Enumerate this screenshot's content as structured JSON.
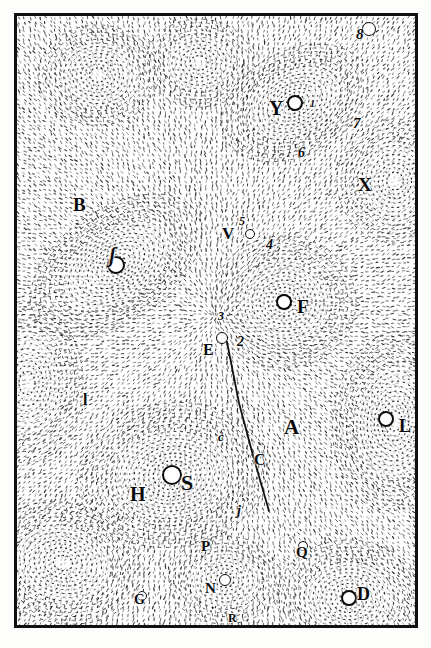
{
  "plate": {
    "kind": "engraved-plate",
    "description": "Descartes vortex cosmology plate",
    "background_color": "#ffffff",
    "ink_color": "#0a0a0a",
    "frame": {
      "x": 14,
      "y": 13,
      "w": 404,
      "h": 615,
      "border_px": 3
    }
  },
  "labels": [
    {
      "id": "S",
      "text": "S",
      "x": 178,
      "y": 469,
      "size": 22,
      "style": "roman"
    },
    {
      "id": "H",
      "text": "H",
      "x": 127,
      "y": 481,
      "size": 20,
      "style": "roman"
    },
    {
      "id": "F",
      "text": "F",
      "x": 294,
      "y": 294,
      "size": 19,
      "style": "roman"
    },
    {
      "id": "A",
      "text": "A",
      "x": 281,
      "y": 414,
      "size": 21,
      "style": "roman"
    },
    {
      "id": "B",
      "text": "B",
      "x": 70,
      "y": 192,
      "size": 19,
      "style": "roman"
    },
    {
      "id": "D",
      "text": "D",
      "x": 354,
      "y": 582,
      "size": 18,
      "style": "roman"
    },
    {
      "id": "E",
      "text": "E",
      "x": 200,
      "y": 339,
      "size": 16,
      "style": "roman"
    },
    {
      "id": "L",
      "text": "L",
      "x": 396,
      "y": 414,
      "size": 18,
      "style": "roman"
    },
    {
      "id": "N",
      "text": "N",
      "x": 202,
      "y": 578,
      "size": 15,
      "style": "roman"
    },
    {
      "id": "P",
      "text": "P",
      "x": 198,
      "y": 536,
      "size": 15,
      "style": "roman"
    },
    {
      "id": "Q",
      "text": "Q",
      "x": 293,
      "y": 542,
      "size": 15,
      "style": "roman"
    },
    {
      "id": "R",
      "text": "R",
      "x": 225,
      "y": 609,
      "size": 12,
      "style": "roman"
    },
    {
      "id": "M",
      "text": "M",
      "x": 222,
      "y": 621,
      "size": 12,
      "style": "roman"
    },
    {
      "id": "G",
      "text": "G",
      "x": 131,
      "y": 590,
      "size": 14,
      "style": "roman"
    },
    {
      "id": "V",
      "text": "V",
      "x": 219,
      "y": 222,
      "size": 17,
      "style": "roman"
    },
    {
      "id": "X",
      "text": "X",
      "x": 355,
      "y": 172,
      "size": 19,
      "style": "roman"
    },
    {
      "id": "Y",
      "text": "Y",
      "x": 266,
      "y": 95,
      "size": 20,
      "style": "roman"
    },
    {
      "id": "C-upper",
      "text": "C",
      "x": 251,
      "y": 449,
      "size": 16,
      "style": "roman"
    },
    {
      "id": "c-lower",
      "text": "c",
      "x": 215,
      "y": 427,
      "size": 13,
      "style": "italic"
    },
    {
      "id": "j",
      "text": "j",
      "x": 234,
      "y": 501,
      "size": 14,
      "style": "italic"
    },
    {
      "id": "l-left",
      "text": "l",
      "x": 80,
      "y": 389,
      "size": 16,
      "style": "roman"
    },
    {
      "id": "longs",
      "text": "ʃ",
      "x": 106,
      "y": 242,
      "size": 20,
      "style": "italic"
    }
  ],
  "numerals": [
    {
      "id": "n8",
      "text": "8",
      "x": 353,
      "y": 24,
      "size": 15
    },
    {
      "id": "n7",
      "text": "7",
      "x": 350,
      "y": 113,
      "size": 15
    },
    {
      "id": "n6",
      "text": "6",
      "x": 295,
      "y": 143,
      "size": 14
    },
    {
      "id": "n5",
      "text": "5",
      "x": 236,
      "y": 212,
      "size": 12
    },
    {
      "id": "n4",
      "text": "4",
      "x": 263,
      "y": 235,
      "size": 14
    },
    {
      "id": "n3",
      "text": "3",
      "x": 215,
      "y": 307,
      "size": 12
    },
    {
      "id": "n2",
      "text": "2",
      "x": 234,
      "y": 332,
      "size": 14
    },
    {
      "id": "n1",
      "text": "1",
      "x": 307,
      "y": 96,
      "size": 10
    }
  ],
  "bodies": [
    {
      "id": "sun-S",
      "cx": 169,
      "cy": 472,
      "r": 10
    },
    {
      "id": "star-F",
      "cx": 281,
      "cy": 299,
      "r": 8
    },
    {
      "id": "star-Y",
      "cx": 292,
      "cy": 100,
      "r": 8
    },
    {
      "id": "star-L",
      "cx": 383,
      "cy": 416,
      "r": 8
    },
    {
      "id": "star-D",
      "cx": 346,
      "cy": 595,
      "r": 8
    },
    {
      "id": "star-long-s",
      "cx": 113,
      "cy": 262,
      "r": 9
    },
    {
      "id": "star-8",
      "cx": 366,
      "cy": 26,
      "r": 7
    },
    {
      "id": "star-E",
      "cx": 219,
      "cy": 335,
      "r": 6
    },
    {
      "id": "star-N",
      "cx": 222,
      "cy": 577,
      "r": 6
    },
    {
      "id": "star-4",
      "cx": 247,
      "cy": 231,
      "r": 5
    },
    {
      "id": "star-Q",
      "cx": 300,
      "cy": 543,
      "r": 5
    },
    {
      "id": "star-G",
      "cx": 139,
      "cy": 593,
      "r": 5
    }
  ],
  "comet_path": {
    "id": "comet-trajectory",
    "points": [
      [
        224,
        339
      ],
      [
        236,
        400
      ],
      [
        251,
        456
      ],
      [
        266,
        508
      ]
    ],
    "stroke": "#111111",
    "width": 1.8
  },
  "vortices": [
    {
      "id": "vortex-unlabeled-topleft",
      "cx": 95,
      "cy": 72,
      "rings": 7,
      "rx": 60,
      "ry": 50,
      "rot": 0
    },
    {
      "id": "vortex-longs",
      "cx": 113,
      "cy": 262,
      "rings": 9,
      "rx": 96,
      "ry": 56,
      "rot": -34
    },
    {
      "id": "vortex-F",
      "cx": 281,
      "cy": 299,
      "rings": 9,
      "rx": 72,
      "ry": 66,
      "rot": 0
    },
    {
      "id": "vortex-Y",
      "cx": 292,
      "cy": 100,
      "rings": 8,
      "rx": 78,
      "ry": 52,
      "rot": -28
    },
    {
      "id": "vortex-S",
      "cx": 169,
      "cy": 472,
      "rings": 10,
      "rx": 95,
      "ry": 72,
      "rot": -8
    },
    {
      "id": "vortex-L",
      "cx": 392,
      "cy": 418,
      "rings": 9,
      "rx": 62,
      "ry": 90,
      "rot": 6
    },
    {
      "id": "vortex-D",
      "cx": 346,
      "cy": 595,
      "rings": 8,
      "rx": 72,
      "ry": 58,
      "rot": 0
    },
    {
      "id": "vortex-lowerleft",
      "cx": 60,
      "cy": 560,
      "rings": 8,
      "rx": 78,
      "ry": 60,
      "rot": 14
    },
    {
      "id": "vortex-N",
      "cx": 222,
      "cy": 577,
      "rings": 6,
      "rx": 56,
      "ry": 44,
      "rot": 0
    },
    {
      "id": "vortex-X",
      "cx": 392,
      "cy": 178,
      "rings": 7,
      "rx": 58,
      "ry": 62,
      "rot": 0
    },
    {
      "id": "vortex-left",
      "cx": 24,
      "cy": 380,
      "rings": 7,
      "rx": 56,
      "ry": 80,
      "rot": 0
    },
    {
      "id": "vortex-topmid",
      "cx": 196,
      "cy": 60,
      "rings": 6,
      "rx": 54,
      "ry": 44,
      "rot": 0
    }
  ]
}
